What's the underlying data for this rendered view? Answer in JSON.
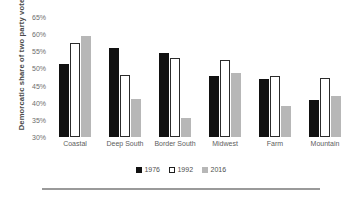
{
  "chart_data": {
    "type": "bar",
    "title": "",
    "xlabel": "",
    "ylabel": "Demorcatic share of two party vote",
    "ylim": [
      30,
      65
    ],
    "yticks": [
      "30%",
      "35%",
      "40%",
      "45%",
      "50%",
      "55%",
      "60%",
      "65%"
    ],
    "ytick_values": [
      30,
      35,
      40,
      45,
      50,
      55,
      60,
      65
    ],
    "ytick_suffix": "%",
    "grid": false,
    "legend_position": "bottom-center",
    "categories": [
      "Coastal",
      "Deep South",
      "Border South",
      "Midwest",
      "Farm",
      "Mountain"
    ],
    "series": [
      {
        "name": "1976",
        "color": "#111111",
        "values": [
          51.4,
          56.0,
          54.6,
          47.7,
          46.9,
          40.8
        ]
      },
      {
        "name": "1992",
        "color": "#ffffff",
        "values": [
          57.5,
          48.1,
          53.0,
          52.5,
          47.8,
          47.3
        ]
      },
      {
        "name": "2016",
        "color": "#b7b7b7",
        "values": [
          59.4,
          41.2,
          35.5,
          48.7,
          39.0,
          42.0
        ]
      }
    ]
  },
  "legend": {
    "items": [
      {
        "label": "1976",
        "swatch": "filled-black-square-icon"
      },
      {
        "label": "1992",
        "swatch": "outlined-white-square-icon"
      },
      {
        "label": "2016",
        "swatch": "filled-gray-square-icon"
      }
    ]
  },
  "colors": {
    "series_1976": "#111111",
    "series_1992": "#ffffff",
    "series_2016": "#b7b7b7",
    "axis_text": "#6d6d6d",
    "rule": "#9a9a9a",
    "background": "#ffffff"
  }
}
